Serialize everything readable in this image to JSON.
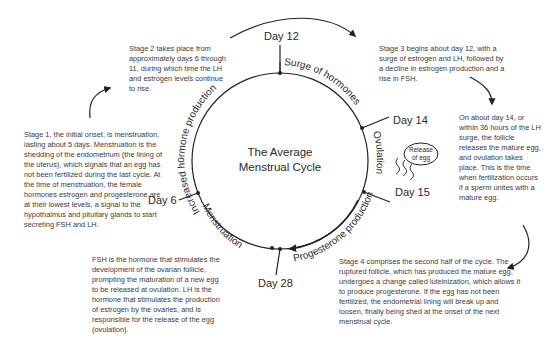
{
  "diagram": {
    "title_line1": "The Average",
    "title_line2": "Menstrual Cycle",
    "days": {
      "day12": "Day 12",
      "day14": "Day 14",
      "day15": "Day 15",
      "day28": "Day 28",
      "day6": "Day 6"
    },
    "phases": {
      "increased": "Increased hormone production",
      "surge": "Surge of hormones",
      "ovulation": "Ovulation",
      "progesterone": "Progesterone production",
      "menstruation": "Menstruation"
    },
    "egg_label_line1": "Release",
    "egg_label_line2": "of egg"
  },
  "notes": {
    "stage1": "Stage 1, the initial onset, is menstruation, lasting about 5 days. Menstruation is the shedding of the endometrium (the lining of the uterus), which signals that an egg has not been fertilized during the last cycle. At the time of menstruation, the  female hormones estrogen and progesterone are at their lowest levels, a signal to the hypothalmus and pituitary glands to start secreting FSH and LH.",
    "stage2": "Stage 2 takes place from approximately days 6 through 11, during which time the LH and estrogen levels continue to rise.",
    "stage3": "Stage 3 begins about day 12, with a surge of estrogen and LH, followed by a decline in estrogen production and a rise in FSH.",
    "ovulation": "On about day 14, or within 36 hours of the LH surge, the follicle releases the mature egg, and ovulation takes place. This is the time when fertilization occurs if a sperm unites with a mature egg.",
    "stage4": "Stage 4 comprises the second half of the cycle. The ruptured follicle, which has produced the mature egg, undergoes a change called luteinization, which allows it to produce progesterone. If the egg has not been fertilized, the endometrial lining will break up and loosen, finally being shed at the onset of the next menstrual cycle.",
    "fsh": "FSH is the hormone that stimulates the development of the ovarian follicle, prompting the maturation of a new egg to be released at ovulation. LH is the hormone that stimulates the production of estrogen by the ovaries, and is responsible for the release of the egg (ovulation)."
  }
}
